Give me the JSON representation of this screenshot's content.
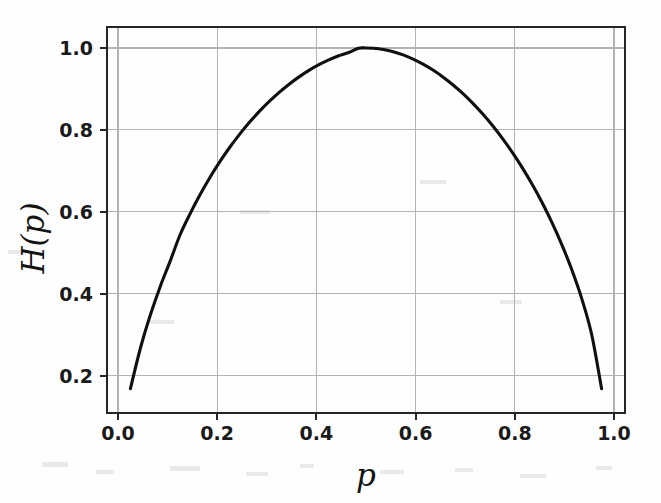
{
  "figure": {
    "background_color": "#fefefe",
    "plot_area": {
      "left": 107,
      "top": 27,
      "right": 625,
      "bottom": 413
    }
  },
  "chart_data": {
    "type": "line",
    "title": "",
    "subtitle": "",
    "xlabel": "p",
    "ylabel": "H(p)",
    "legend": [],
    "legend_position": "none",
    "grid": true,
    "xlim": [
      -0.0222,
      1.0222
    ],
    "ylim": [
      0.1093,
      1.0512
    ],
    "xticks": [
      0.0,
      0.2,
      0.4,
      0.6,
      0.8,
      1.0
    ],
    "xtick_labels": [
      "0.0",
      "0.2",
      "0.4",
      "0.6",
      "0.8",
      "1.0"
    ],
    "yticks": [
      0.2,
      0.4,
      0.6,
      0.8,
      1.0
    ],
    "ytick_labels": [
      "0.2",
      "0.4",
      "0.6",
      "0.8",
      "1.0"
    ],
    "series": [
      {
        "name": "binary entropy",
        "color": "#101010",
        "linewidth": 3.1,
        "x": [
          0.025,
          0.045,
          0.065,
          0.085,
          0.105,
          0.125,
          0.145,
          0.165,
          0.185,
          0.205,
          0.225,
          0.245,
          0.265,
          0.285,
          0.305,
          0.325,
          0.345,
          0.365,
          0.385,
          0.405,
          0.425,
          0.445,
          0.465,
          0.485,
          0.5,
          0.515,
          0.535,
          0.555,
          0.575,
          0.595,
          0.615,
          0.635,
          0.655,
          0.675,
          0.695,
          0.715,
          0.735,
          0.755,
          0.775,
          0.795,
          0.815,
          0.835,
          0.855,
          0.875,
          0.895,
          0.915,
          0.935,
          0.955,
          0.975
        ],
        "y": [
          0.1687,
          0.2667,
          0.3476,
          0.4176,
          0.4794,
          0.5436,
          0.5947,
          0.6411,
          0.6834,
          0.7219,
          0.7571,
          0.7892,
          0.8186,
          0.8454,
          0.8697,
          0.8918,
          0.9117,
          0.9295,
          0.9453,
          0.9591,
          0.971,
          0.9809,
          0.9889,
          0.9994,
          1.0,
          0.9994,
          0.9963,
          0.9909,
          0.9831,
          0.973,
          0.9607,
          0.9462,
          0.9294,
          0.9104,
          0.8892,
          0.8655,
          0.8394,
          0.8108,
          0.7795,
          0.7453,
          0.708,
          0.6673,
          0.6228,
          0.5738,
          0.5196,
          0.4587,
          0.3883,
          0.3008,
          0.1687
        ]
      }
    ],
    "formula": "H(p) = -p*log2(p) - (1-p)*log2(1-p)"
  }
}
